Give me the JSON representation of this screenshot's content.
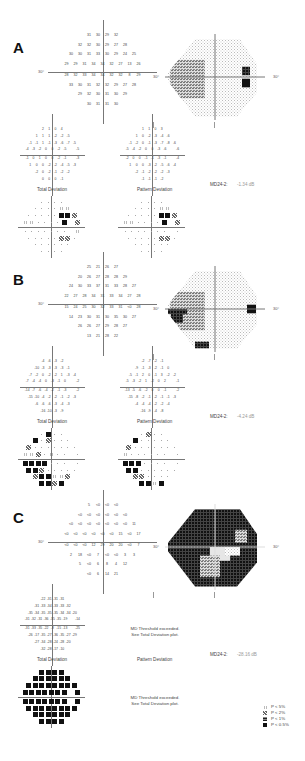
{
  "legend": {
    "title": "",
    "items": [
      {
        "symbol": "p5",
        "label": "P < 5%"
      },
      {
        "symbol": "p2",
        "label": "P < 2%"
      },
      {
        "symbol": "p1",
        "label": "P < 1%"
      },
      {
        "symbol": "p05",
        "label": "P < 0.5%"
      }
    ]
  },
  "axis_label": "30°",
  "panels": [
    {
      "id": "A",
      "label": "A",
      "threshold": [
        [
          "31",
          "30",
          "29",
          "32"
        ],
        [
          "32",
          "32",
          "30",
          "29",
          "27",
          "28"
        ],
        [
          "30",
          "30",
          "31",
          "33",
          "30",
          "29",
          "24",
          "25"
        ],
        [
          "29",
          "29",
          "31",
          "34",
          "34",
          "32",
          "27",
          "13",
          "26"
        ],
        [
          "28",
          "32",
          "33",
          "34",
          "34",
          "32",
          "32",
          "8",
          "29"
        ],
        [
          "33",
          "30",
          "31",
          "32",
          "32",
          "29",
          "27",
          "28"
        ],
        [
          "29",
          "32",
          "30",
          "31",
          "30",
          "29"
        ],
        [
          "30",
          "31",
          "31",
          "30"
        ]
      ],
      "total_deviation": [
        [
          "2",
          "1",
          "0",
          "4"
        ],
        [
          "1",
          "1",
          "1",
          "-2",
          "-2",
          "-5"
        ],
        [
          "-1",
          "-1",
          "1",
          "-1",
          "-3",
          "-6",
          "-7",
          "-5"
        ],
        [
          "-4",
          "-3",
          "-2",
          "0",
          "0",
          "-2",
          "-5",
          "",
          "-5"
        ],
        [
          "-1",
          "0",
          "1",
          "0",
          "0",
          "-2",
          "-1",
          "",
          "-3"
        ],
        [
          "1",
          "0",
          "0",
          "-2",
          "-2",
          "-4",
          "-5",
          "-3"
        ],
        [
          "-2",
          "0",
          "-2",
          "-1",
          "-2",
          "-2"
        ],
        [
          "0",
          "0",
          "0",
          "-1"
        ]
      ],
      "total_label": "Total Deviation",
      "pattern_deviation": [
        [
          "1",
          "1",
          "0",
          "3"
        ],
        [
          "1",
          "0",
          "-2",
          "-3",
          "-4",
          "-6"
        ],
        [
          "-1",
          "-2",
          "0",
          "-1",
          "-3",
          "-7",
          "-8",
          "-6"
        ],
        [
          "-5",
          "-4",
          "-2",
          "0",
          "0",
          "-3",
          "-6",
          "",
          "-6"
        ],
        [
          "-2",
          "0",
          "0",
          "-1",
          "-1",
          "-3",
          "-1",
          "",
          "-4"
        ],
        [
          "1",
          "0",
          "0",
          "-3",
          "-2",
          "-5",
          "-6",
          "-4"
        ],
        [
          "-2",
          "-1",
          "-2",
          "-2",
          "-2",
          "-3"
        ],
        [
          "-1",
          "-1",
          "-1",
          "-2"
        ]
      ],
      "pattern_label": "Pattern Deviation",
      "pattern_note": "",
      "md_label": "MD24-2:",
      "md_value": "-1.34 dB",
      "total_prob": [
        [
          "dot",
          "dot",
          "dot",
          "dot"
        ],
        [
          "dot",
          "dot",
          "dot",
          "dot",
          "p5",
          "p5"
        ],
        [
          "dot",
          "dot",
          "dot",
          "dot",
          "dot",
          "p05",
          "p05",
          "p2"
        ],
        [
          "p5",
          "p5",
          "dot",
          "dot",
          "dot",
          "dot",
          "p05",
          "",
          "p2"
        ],
        [
          "dot",
          "dot",
          "dot",
          "dot",
          "dot",
          "dot",
          "dot",
          "",
          "p5"
        ],
        [
          "dot",
          "dot",
          "dot",
          "dot",
          "dot",
          "p2",
          "p2",
          "dot"
        ],
        [
          "dot",
          "dot",
          "dot",
          "dot",
          "dot",
          "dot"
        ],
        [
          "dot",
          "dot",
          "dot",
          "dot"
        ]
      ],
      "pattern_prob": [
        [
          "dot",
          "dot",
          "dot",
          "dot"
        ],
        [
          "dot",
          "dot",
          "dot",
          "dot",
          "p5",
          "p5"
        ],
        [
          "dot",
          "dot",
          "dot",
          "dot",
          "dot",
          "p05",
          "p05",
          "p2"
        ],
        [
          "p5",
          "p5",
          "dot",
          "dot",
          "dot",
          "dot",
          "p05",
          "",
          "p2"
        ],
        [
          "dot",
          "dot",
          "dot",
          "dot",
          "dot",
          "dot",
          "dot",
          "",
          "dot"
        ],
        [
          "dot",
          "dot",
          "dot",
          "dot",
          "dot",
          "p2",
          "p2",
          "dot"
        ],
        [
          "dot",
          "dot",
          "dot",
          "dot",
          "dot",
          "dot"
        ],
        [
          "dot",
          "dot",
          "dot",
          "dot"
        ]
      ],
      "pattern_prob_note": "",
      "grayscale": "mild"
    },
    {
      "id": "B",
      "label": "B",
      "threshold": [
        [
          "25",
          "21",
          "26",
          "27"
        ],
        [
          "20",
          "26",
          "27",
          "28",
          "28",
          "29"
        ],
        [
          "24",
          "30",
          "33",
          "37",
          "31",
          "33",
          "28",
          "27"
        ],
        [
          "22",
          "27",
          "28",
          "34",
          "31",
          "33",
          "34",
          "27",
          "28"
        ],
        [
          "15",
          "24",
          "25",
          "30",
          "32",
          "33",
          "31",
          "<0",
          "28"
        ],
        [
          "14",
          "23",
          "30",
          "31",
          "30",
          "35",
          "30",
          "27"
        ],
        [
          "26",
          "26",
          "27",
          "29",
          "28",
          "27"
        ],
        [
          "13",
          "21",
          "28",
          "22"
        ]
      ],
      "total_deviation": [
        [
          "-4",
          "-6",
          "-3",
          "-2"
        ],
        [
          "-10",
          "-3",
          "-3",
          "-3",
          "-3",
          "-1"
        ],
        [
          "-7",
          "-2",
          "0",
          "-2",
          "-2",
          "1",
          "-3",
          "-4"
        ],
        [
          "-7",
          "-4",
          "-4",
          "0",
          "-3",
          "-1",
          "0",
          "",
          "-2"
        ],
        [
          "-14",
          "-7",
          "-6",
          "-4",
          "-2",
          "-1",
          "-3",
          "",
          "-2"
        ],
        [
          "-15",
          "-10",
          "-4",
          "-2",
          "-2",
          "-1",
          "-2",
          "-3"
        ],
        [
          "-6",
          "-6",
          "-6",
          "-3",
          "-4",
          "-3"
        ],
        [
          "-16",
          "-10",
          "-3",
          "-9"
        ]
      ],
      "total_label": "Total Deviation",
      "pattern_deviation": [
        [
          "-2",
          "-7",
          "-2",
          "-1"
        ],
        [
          "-9",
          "-1",
          "-3",
          "-2",
          "-1",
          "0"
        ],
        [
          "-5",
          "-1",
          "2",
          "0",
          "-1",
          "3",
          "-2",
          "-2"
        ],
        [
          "-5",
          "-3",
          "-2",
          "1",
          "-2",
          "0",
          "2",
          "",
          "-1"
        ],
        [
          "-13",
          "-5",
          "-6",
          "-2",
          "0",
          "0",
          "-1",
          "",
          "-2"
        ],
        [
          "-15",
          "-8",
          "-2",
          "-1",
          "-2",
          "-1",
          "-1",
          "-3"
        ],
        [
          "-4",
          "-4",
          "-4",
          "-2",
          "-2",
          "-4"
        ],
        [
          "-16",
          "-9",
          "-4",
          "-8"
        ]
      ],
      "pattern_label": "Pattern Deviation",
      "pattern_note": "",
      "md_label": "MD24-2:",
      "md_value": "-4.24 dB",
      "total_prob": [
        [
          "dot",
          "p05",
          "dot",
          "dot"
        ],
        [
          "p05",
          "dot",
          "p2",
          "dot",
          "dot",
          "dot"
        ],
        [
          "p2",
          "dot",
          "dot",
          "dot",
          "dot",
          "dot",
          "dot",
          "dot"
        ],
        [
          "p5",
          "p5",
          "p2",
          "dot",
          "p5",
          "dot",
          "dot",
          "",
          "dot"
        ],
        [
          "p05",
          "p05",
          "p05",
          "p05",
          "dot",
          "dot",
          "dot",
          "",
          "dot"
        ],
        [
          "p05",
          "p05",
          "p2",
          "dot",
          "dot",
          "dot",
          "dot",
          "dot"
        ],
        [
          "p2",
          "p05",
          "p05",
          "p5",
          "p5",
          "p2"
        ],
        [
          "p05",
          "p05",
          "p2",
          "p05"
        ]
      ],
      "pattern_prob": [
        [
          "dot",
          "p2",
          "dot",
          "dot"
        ],
        [
          "p05",
          "dot",
          "dot",
          "dot",
          "dot",
          "dot"
        ],
        [
          "p2",
          "dot",
          "dot",
          "dot",
          "dot",
          "dot",
          "dot",
          "dot"
        ],
        [
          "p5",
          "dot",
          "dot",
          "dot",
          "dot",
          "dot",
          "dot",
          "",
          "dot"
        ],
        [
          "p05",
          "p05",
          "p05",
          "dot",
          "dot",
          "dot",
          "dot",
          "",
          "dot"
        ],
        [
          "p05",
          "p05",
          "dot",
          "dot",
          "dot",
          "dot",
          "dot",
          "dot"
        ],
        [
          "p2",
          "p2",
          "dot",
          "dot",
          "dot",
          "dot"
        ],
        [
          "p05",
          "p05",
          "p5",
          "p05"
        ]
      ],
      "pattern_prob_note": "",
      "grayscale": "moderate"
    },
    {
      "id": "C",
      "label": "C",
      "threshold": [
        [
          "5",
          "<0",
          "<0",
          "<0"
        ],
        [
          "<0",
          "<0",
          "<0",
          "<0",
          "<0",
          "<0"
        ],
        [
          "<0",
          "<0",
          "<0",
          "<0",
          "<0",
          "<0",
          "<0",
          "11"
        ],
        [
          "<0",
          "<0",
          "<0",
          "<0",
          "<0",
          "<0",
          "15",
          "<0",
          "17"
        ],
        [
          "<0",
          "<0",
          "<0",
          "12",
          "29",
          "20",
          "20",
          "<0",
          "7"
        ],
        [
          "2",
          "18",
          "<0",
          "7",
          "<0",
          "<0",
          "3",
          "3"
        ],
        [
          "5",
          "<0",
          "6",
          "8",
          "4",
          "12"
        ],
        [
          "<0",
          "6",
          "14",
          "21"
        ]
      ],
      "total_deviation": [
        [
          "-22",
          "-31",
          "-31",
          "-31"
        ],
        [
          "-31",
          "-33",
          "-34",
          "-33",
          "-33",
          "-32"
        ],
        [
          "-35",
          "-34",
          "-35",
          "-35",
          "-35",
          "-34",
          "-34",
          "-20"
        ],
        [
          "-31",
          "-32",
          "-31",
          "-36",
          "-35",
          "-35",
          "-19",
          "",
          "-14"
        ],
        [
          "-31",
          "-33",
          "-35",
          "-22",
          "-8",
          "-15",
          "-13",
          "",
          "-25"
        ],
        [
          "-26",
          "-17",
          "-35",
          "-27",
          "-36",
          "-35",
          "-27",
          "-29"
        ],
        [
          "-27",
          "-34",
          "-28",
          "-24",
          "-28",
          "-20"
        ],
        [
          "-32",
          "-28",
          "-17",
          "-10"
        ]
      ],
      "total_label": "Total Deviation",
      "pattern_deviation": [],
      "pattern_label": "Pattern Deviation",
      "pattern_note": [
        "MD Threshold exceeded.",
        "See Total Deviation plot."
      ],
      "md_label": "MD24-2:",
      "md_value": "-28.16 dB",
      "total_prob": [
        [
          "p05",
          "p05",
          "p05",
          "p05"
        ],
        [
          "p05",
          "p05",
          "p05",
          "p05",
          "p05",
          "p05"
        ],
        [
          "p05",
          "p05",
          "p05",
          "p05",
          "p05",
          "p05",
          "p05",
          "p05"
        ],
        [
          "p05",
          "p05",
          "p05",
          "p05",
          "p05",
          "p05",
          "p05",
          "",
          "p05"
        ],
        [
          "p05",
          "p05",
          "p05",
          "p05",
          "p05",
          "p05",
          "p05",
          "",
          "p05"
        ],
        [
          "p05",
          "p05",
          "p05",
          "p05",
          "p05",
          "p05",
          "p05",
          "p05"
        ],
        [
          "p05",
          "p05",
          "p05",
          "p05",
          "p05",
          "p05"
        ],
        [
          "p05",
          "p05",
          "p05",
          "p05"
        ]
      ],
      "pattern_prob": [],
      "pattern_prob_note": [
        "MD Threshold exceeded.",
        "See Total Deviation plot."
      ],
      "grayscale": "severe"
    }
  ]
}
